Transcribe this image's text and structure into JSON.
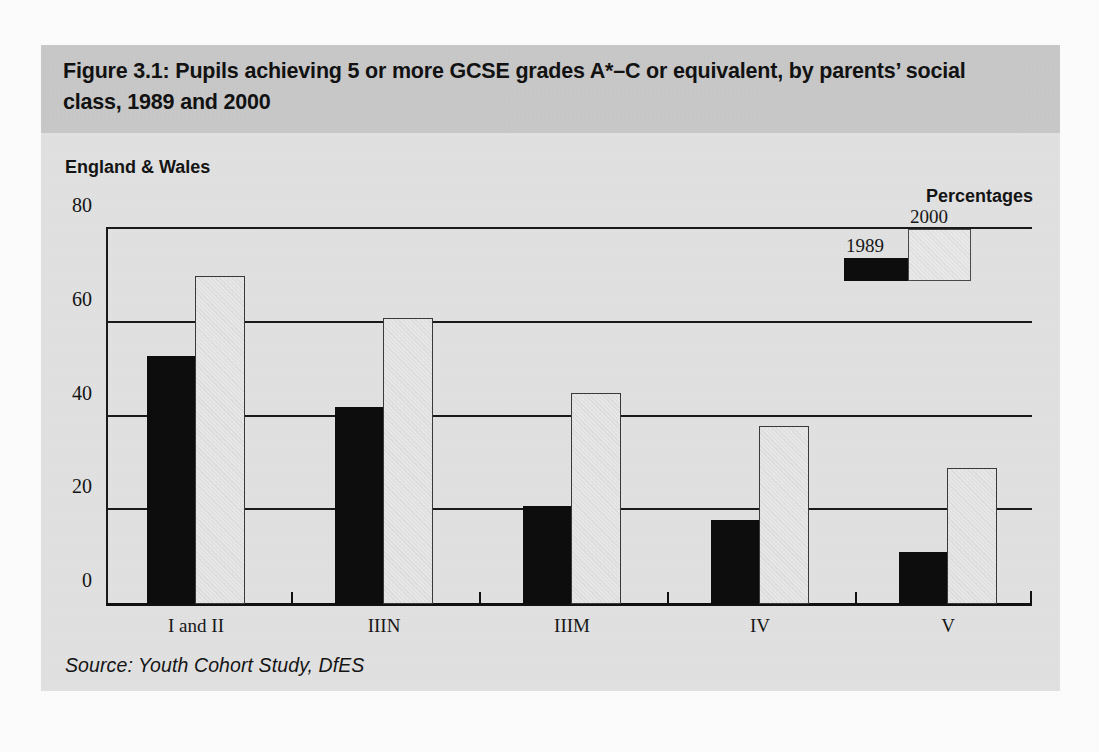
{
  "figure": {
    "title": "Figure 3.1: Pupils achieving 5 or more GCSE grades A*–C or equivalent, by parents’ social class, 1989 and 2000",
    "subtitle_left": "England & Wales",
    "subtitle_right": "Percentages",
    "source": "Source: Youth Cohort Study, DfES"
  },
  "legend": {
    "items": [
      {
        "label": "1989",
        "color": "#0d0d0d"
      },
      {
        "label": "2000",
        "color": "#eaeaea"
      }
    ]
  },
  "axis": {
    "y_ticks": [
      "0",
      "20",
      "40",
      "60",
      "80"
    ],
    "y_tick_values": [
      0,
      20,
      40,
      60,
      80
    ]
  },
  "chart_data": {
    "type": "bar",
    "title": "Figure 3.1: Pupils achieving 5 or more GCSE grades A*–C or equivalent, by parents’ social class, 1989 and 2000",
    "subtitle": "England & Wales",
    "xlabel": "",
    "ylabel": "Percentages",
    "ylim": [
      0,
      80
    ],
    "yticks": [
      0,
      20,
      40,
      60,
      80
    ],
    "grid": true,
    "legend_position": "top-right",
    "categories": [
      "I and II",
      "IIIN",
      "IIIM",
      "IV",
      "V"
    ],
    "series": [
      {
        "name": "1989",
        "color": "#0d0d0d",
        "values": [
          53,
          42,
          21,
          18,
          11
        ]
      },
      {
        "name": "2000",
        "color": "#eaeaea",
        "values": [
          70,
          61,
          45,
          38,
          29
        ]
      }
    ],
    "source": "Source: Youth Cohort Study, DfES"
  }
}
